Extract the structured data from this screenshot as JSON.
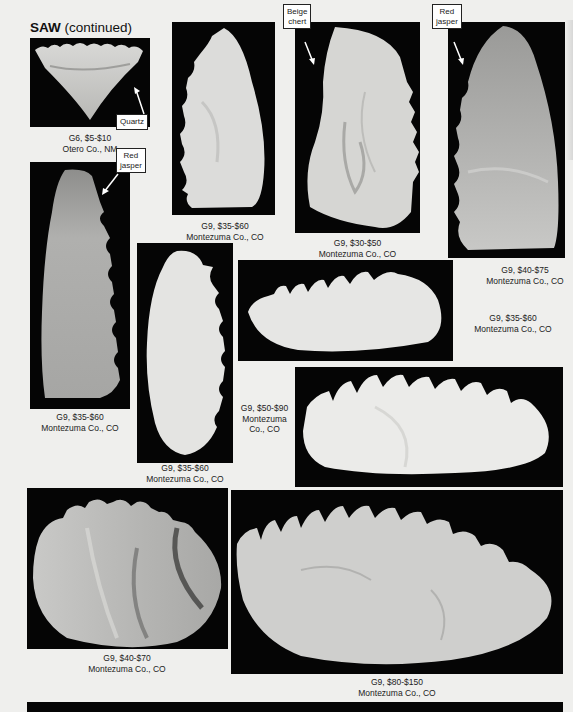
{
  "header": {
    "title_bold": "SAW",
    "title_rest": " (continued)"
  },
  "specimens": [
    {
      "grade_price": "G6, $5-$10",
      "location": "Otero Co., NM",
      "material": "Quartz"
    },
    {
      "grade_price": "G9, $35-$60",
      "location": "Montezuma Co., CO"
    },
    {
      "grade_price": "G9, $30-$50",
      "location": "Montezuma Co., CO",
      "material": "Beige chert"
    },
    {
      "grade_price": "G9, $40-$75",
      "location": "Montezuma Co., CO",
      "material": "Red jasper"
    },
    {
      "grade_price": "G9, $35-$60",
      "location": "Montezuma Co., CO",
      "material": "Red jasper"
    },
    {
      "grade_price": "G9, $35-$60",
      "location": "Montezuma Co., CO"
    },
    {
      "grade_price": "G9, $35-$60",
      "location": "Montezuma Co., CO"
    },
    {
      "grade_price": "G9, $50-$90",
      "location_line1": "Montezuma",
      "location_line2": "Co., CO"
    },
    {
      "grade_price": "G9, $40-$70",
      "location": "Montezuma Co., CO"
    },
    {
      "grade_price": "G9, $80-$150",
      "location": "Montezuma Co., CO"
    }
  ],
  "callouts": {
    "quartz": "Quartz",
    "beige_line1": "Beige",
    "beige_line2": "chert",
    "red1_line1": "Red",
    "red1_line2": "jasper",
    "red2_line1": "Red",
    "red2_line2": "jasper"
  }
}
